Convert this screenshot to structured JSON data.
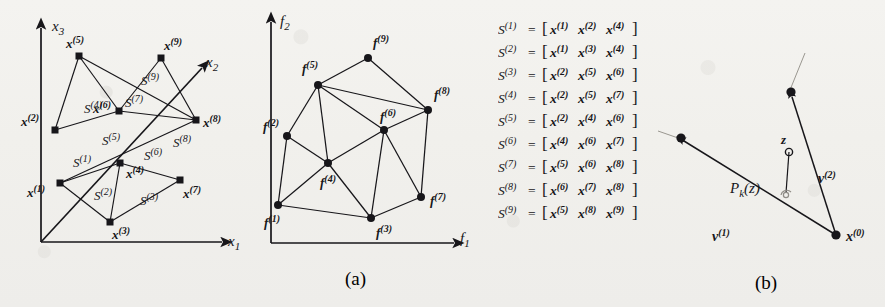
{
  "figure": {
    "kind": "two-panel-scientific-figure",
    "ink_color": "#17161a",
    "paper_color": "#f2f1ee",
    "captions": {
      "left": "(a)",
      "right": "(b)"
    }
  },
  "panel_a": {
    "design_space": {
      "axes": {
        "x_axis": "x",
        "x_axis_sub": "1",
        "y_axis": "x",
        "y_axis_sub": "3",
        "z_axis": "x",
        "z_axis_sub": "2"
      },
      "point_labels": [
        "x(1)",
        "x(2)",
        "x(3)",
        "x(4)",
        "x(5)",
        "x(6)",
        "x(7)",
        "x(8)",
        "x(9)"
      ],
      "simplex_labels": [
        "S(1)",
        "S(2)",
        "S(3)",
        "S(4)",
        "S(5)",
        "S(6)",
        "S(7)",
        "S(8)",
        "S(9)"
      ]
    },
    "objective_space": {
      "axes": {
        "x_axis": "f",
        "x_axis_sub": "1",
        "y_axis": "f",
        "y_axis_sub": "2"
      },
      "point_labels": [
        "f(1)",
        "f(2)",
        "f(3)",
        "f(4)",
        "f(5)",
        "f(6)",
        "f(7)",
        "f(8)",
        "f(9)"
      ]
    },
    "simplex_list": [
      {
        "lhs": "S",
        "lhs_sup": "(1)",
        "v1": "(1)",
        "v2": "(2)",
        "v3": "(4)"
      },
      {
        "lhs": "S",
        "lhs_sup": "(2)",
        "v1": "(1)",
        "v2": "(3)",
        "v3": "(4)"
      },
      {
        "lhs": "S",
        "lhs_sup": "(3)",
        "v1": "(2)",
        "v2": "(5)",
        "v3": "(6)"
      },
      {
        "lhs": "S",
        "lhs_sup": "(4)",
        "v1": "(2)",
        "v2": "(5)",
        "v3": "(7)"
      },
      {
        "lhs": "S",
        "lhs_sup": "(5)",
        "v1": "(2)",
        "v2": "(4)",
        "v3": "(6)"
      },
      {
        "lhs": "S",
        "lhs_sup": "(6)",
        "v1": "(4)",
        "v2": "(6)",
        "v3": "(7)"
      },
      {
        "lhs": "S",
        "lhs_sup": "(7)",
        "v1": "(5)",
        "v2": "(6)",
        "v3": "(8)"
      },
      {
        "lhs": "S",
        "lhs_sup": "(8)",
        "v1": "(6)",
        "v2": "(7)",
        "v3": "(8)"
      },
      {
        "lhs": "S",
        "lhs_sup": "(9)",
        "v1": "(5)",
        "v2": "(8)",
        "v3": "(9)"
      }
    ],
    "simplex_list_symbols": {
      "equals": "=",
      "open": "[",
      "close": "]",
      "vector": "x"
    }
  },
  "panel_b": {
    "labels": {
      "projection": "P",
      "projection_sub": "k",
      "projection_arg": "(z)",
      "point_z": "z",
      "vector_1": "v",
      "vector_1_sup": "(1)",
      "vector_2": "v",
      "vector_2_sup": "(2)",
      "origin": "x",
      "origin_sup": "(0)"
    }
  }
}
